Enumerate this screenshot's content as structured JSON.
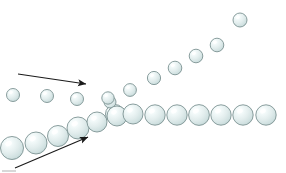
{
  "figure": {
    "title": "Particle stream convergence and splitting diagram",
    "background_color": "#ffffff",
    "width": 286,
    "height": 173
  },
  "style": {
    "sphere_fill_light": "#f4fafa",
    "sphere_fill_mid": "#dce9e9",
    "sphere_fill_dark": "#b9cfcf",
    "sphere_stroke": "#7d9393",
    "sphere_highlight": "#ffffff",
    "arrow_color": "#1a1a1a",
    "artifact_color": "#c8c8c8"
  },
  "arrows": [
    {
      "name": "incoming-top-arrow",
      "label": "incoming small particle stream",
      "x1": 18,
      "y1": 74,
      "x2": 86,
      "y2": 84,
      "head_angle_deg": 8
    },
    {
      "name": "incoming-bottom-arrow",
      "label": "incoming large particle stream",
      "x1": 15,
      "y1": 168,
      "x2": 88,
      "y2": 137,
      "head_angle_deg": -23
    }
  ],
  "streams": [
    {
      "name": "upper-left-inflow",
      "label": "Upper left inflow of small spheres",
      "count": 3,
      "spheres": [
        {
          "cx": 13,
          "cy": 95,
          "r": 6.5
        },
        {
          "cx": 47,
          "cy": 96,
          "r": 6.5
        },
        {
          "cx": 77,
          "cy": 99,
          "r": 6.5
        }
      ]
    },
    {
      "name": "lower-left-inflow",
      "label": "Lower left inflow of large spheres",
      "count": 6,
      "spheres": [
        {
          "cx": 12,
          "cy": 148,
          "r": 11.5
        },
        {
          "cx": 36,
          "cy": 143,
          "r": 11.0
        },
        {
          "cx": 58,
          "cy": 136,
          "r": 10.5
        },
        {
          "cx": 78,
          "cy": 128,
          "r": 11.0
        },
        {
          "cx": 97,
          "cy": 122,
          "r": 10.0
        },
        {
          "cx": 115,
          "cy": 114,
          "r": 9.5
        }
      ]
    },
    {
      "name": "junction-cluster",
      "label": "Junction where streams meet",
      "count": 2,
      "spheres": [
        {
          "cx": 110,
          "cy": 102,
          "r": 6.0
        },
        {
          "cx": 117,
          "cy": 116,
          "r": 10.0
        }
      ]
    },
    {
      "name": "ascending-outflow",
      "label": "Ascending outflow of small spheres",
      "count": 8,
      "spheres": [
        {
          "cx": 108,
          "cy": 98,
          "r": 6.2
        },
        {
          "cx": 130,
          "cy": 90,
          "r": 6.4
        },
        {
          "cx": 154,
          "cy": 78,
          "r": 6.6
        },
        {
          "cx": 175,
          "cy": 68,
          "r": 6.8
        },
        {
          "cx": 196,
          "cy": 56,
          "r": 6.8
        },
        {
          "cx": 217,
          "cy": 45,
          "r": 6.8
        },
        {
          "cx": 240,
          "cy": 20,
          "r": 7.0
        }
      ]
    },
    {
      "name": "horizontal-outflow",
      "label": "Horizontal outflow of medium spheres",
      "count": 9,
      "spheres": [
        {
          "cx": 133,
          "cy": 114,
          "r": 10.0
        },
        {
          "cx": 155,
          "cy": 115,
          "r": 10.2
        },
        {
          "cx": 177,
          "cy": 115,
          "r": 10.2
        },
        {
          "cx": 199,
          "cy": 115,
          "r": 10.4
        },
        {
          "cx": 221,
          "cy": 115,
          "r": 10.2
        },
        {
          "cx": 243,
          "cy": 115,
          "r": 10.2
        },
        {
          "cx": 266,
          "cy": 115,
          "r": 10.2
        }
      ]
    }
  ],
  "artifacts": [
    {
      "name": "bottom-left-rule-artifact",
      "x1": 2,
      "y1": 171,
      "x2": 16,
      "y2": 171
    }
  ]
}
